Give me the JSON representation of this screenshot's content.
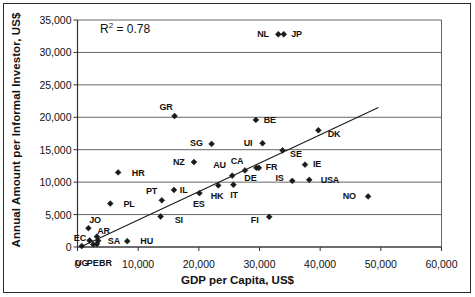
{
  "chart_data": {
    "type": "scatter",
    "title": "",
    "xlabel": "GDP per Capita, US$",
    "ylabel": "Annual Amount per Informal Investor, US$",
    "xlim": [
      0,
      60000
    ],
    "ylim": [
      0,
      35000
    ],
    "xticks": [
      "0",
      "10,000",
      "20,000",
      "30,000",
      "40,000",
      "50,000",
      "60,000"
    ],
    "xtick_values": [
      0,
      10000,
      20000,
      30000,
      40000,
      50000,
      60000
    ],
    "yticks": [
      "0",
      "5,000",
      "10,000",
      "15,000",
      "20,000",
      "25,000",
      "30,000",
      "35,000"
    ],
    "ytick_values": [
      0,
      5000,
      10000,
      15000,
      20000,
      25000,
      30000,
      35000
    ],
    "grid": "horizontal",
    "legend": "none",
    "annotations": [
      {
        "text": "R² = 0.78",
        "base": "R",
        "sup": "2",
        "rest": " = 0.78",
        "x": 5500,
        "y": 32900
      }
    ],
    "trendline": {
      "x_start": 500,
      "y_start": 0,
      "x_end": 49600,
      "y_end": 21500
    },
    "marker": "diamond",
    "marker_color": "#1a1a1a",
    "points": [
      {
        "label": "UG",
        "x": 700,
        "y": 150,
        "lx": 700,
        "ly": -2400
      },
      {
        "label": "EC",
        "x": 2000,
        "y": 1000,
        "lx": 400,
        "ly": 1350
      },
      {
        "label": "PE",
        "x": 2600,
        "y": 400,
        "lx": 2500,
        "ly": -2400
      },
      {
        "label": "BR",
        "x": 3200,
        "y": 450,
        "lx": 4600,
        "ly": -2400
      },
      {
        "label": "JO",
        "x": 1800,
        "y": 2900,
        "lx": 2900,
        "ly": 4100
      },
      {
        "label": "AR",
        "x": 3200,
        "y": 1600,
        "lx": 4300,
        "ly": 2500
      },
      {
        "label": "SA",
        "x": 3400,
        "y": 950,
        "lx": 6000,
        "ly": 850
      },
      {
        "label": "HU",
        "x": 8200,
        "y": 900,
        "lx": 11400,
        "ly": 850
      },
      {
        "label": "PL",
        "x": 5400,
        "y": 6700,
        "lx": 8500,
        "ly": 6650
      },
      {
        "label": "HR",
        "x": 6700,
        "y": 11500,
        "lx": 10000,
        "ly": 11450
      },
      {
        "label": "SI",
        "x": 13700,
        "y": 4700,
        "lx": 16700,
        "ly": 4200
      },
      {
        "label": "PT",
        "x": 13900,
        "y": 7200,
        "lx": 12200,
        "ly": 8700
      },
      {
        "label": "IL",
        "x": 15900,
        "y": 8800,
        "lx": 17500,
        "ly": 8800
      },
      {
        "label": "GR",
        "x": 16000,
        "y": 20200,
        "lx": 14600,
        "ly": 21650
      },
      {
        "label": "NZ",
        "x": 19200,
        "y": 13100,
        "lx": 16700,
        "ly": 13100
      },
      {
        "label": "ES",
        "x": 20100,
        "y": 8300,
        "lx": 20000,
        "ly": 6700
      },
      {
        "label": "SG",
        "x": 22100,
        "y": 15900,
        "lx": 19600,
        "ly": 16000
      },
      {
        "label": "HK",
        "x": 23200,
        "y": 9500,
        "lx": 23000,
        "ly": 7900
      },
      {
        "label": "AU",
        "x": 25500,
        "y": 11000,
        "lx": 23400,
        "ly": 12700
      },
      {
        "label": "IT",
        "x": 25700,
        "y": 9600,
        "lx": 25800,
        "ly": 7950
      },
      {
        "label": "CA",
        "x": 27600,
        "y": 11800,
        "lx": 26300,
        "ly": 13250
      },
      {
        "label": "DE",
        "x": 29500,
        "y": 12200,
        "lx": 28500,
        "ly": 10600
      },
      {
        "label": "FR",
        "x": 29900,
        "y": 12200,
        "lx": 32000,
        "ly": 12300
      },
      {
        "label": "BE",
        "x": 29400,
        "y": 19600,
        "lx": 31700,
        "ly": 19650
      },
      {
        "label": "UI",
        "x": 30500,
        "y": 16000,
        "lx": 28100,
        "ly": 16050
      },
      {
        "label": "FI",
        "x": 31600,
        "y": 4650,
        "lx": 29200,
        "ly": 4200
      },
      {
        "label": "NL",
        "x": 33100,
        "y": 32800,
        "lx": 30600,
        "ly": 32850
      },
      {
        "label": "JP",
        "x": 34000,
        "y": 32800,
        "lx": 36100,
        "ly": 32850
      },
      {
        "label": "SE",
        "x": 33800,
        "y": 14900,
        "lx": 36000,
        "ly": 14350
      },
      {
        "label": "IS",
        "x": 35400,
        "y": 10200,
        "lx": 33300,
        "ly": 10700
      },
      {
        "label": "IE",
        "x": 37500,
        "y": 12700,
        "lx": 39500,
        "ly": 12750
      },
      {
        "label": "USA",
        "x": 38200,
        "y": 10350,
        "lx": 41600,
        "ly": 10350
      },
      {
        "label": "DK",
        "x": 39700,
        "y": 18000,
        "lx": 42300,
        "ly": 17450
      },
      {
        "label": "NO",
        "x": 47900,
        "y": 7800,
        "lx": 44800,
        "ly": 7800
      }
    ]
  }
}
